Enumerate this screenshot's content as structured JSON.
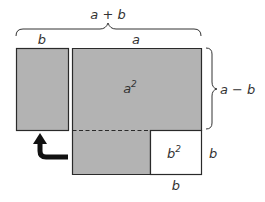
{
  "diagram": {
    "colors": {
      "fill": "#b3b3b3",
      "stroke": "#2a2a2a",
      "white": "#ffffff",
      "text": "#333333",
      "arrow": "#111111"
    },
    "labels": {
      "top_total": "a + b",
      "top_left": "b",
      "top_right": "a",
      "right_brace": "a − b",
      "big_square": "a",
      "big_square_exp": "2",
      "small_square": "b",
      "small_square_exp": "2",
      "small_right": "b",
      "small_bottom": "b"
    },
    "shapes": {
      "moved_rect": "b × (a − b) rectangle moved to left",
      "big_square": "a² region",
      "removed_square": "b² region (white)",
      "arrow": "curved arrow indicating move"
    }
  }
}
